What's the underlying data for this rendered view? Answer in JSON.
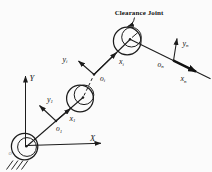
{
  "figure": {
    "background": "#fbfbfb",
    "ink": "#1c1c1c",
    "callout": {
      "label": "Clearance Joint"
    },
    "global_frame": {
      "y_label": "Y",
      "x_label": "X",
      "origin_label": "o"
    },
    "frames": {
      "link1": {
        "y": "y",
        "y_sub": "1",
        "x": "x",
        "x_sub": "1",
        "origin": "o",
        "origin_sub": "1"
      },
      "linki": {
        "y": "y",
        "y_sub": "i",
        "x": "x",
        "x_sub": "i",
        "origin": "o",
        "origin_sub": "i"
      },
      "linkn": {
        "y": "y",
        "y_sub": "n",
        "x": "x",
        "x_sub": "n",
        "origin": "o",
        "origin_sub": "n"
      }
    }
  }
}
